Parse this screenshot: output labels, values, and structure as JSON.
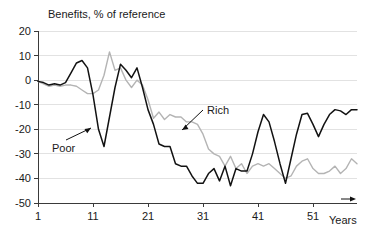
{
  "chart_data": {
    "type": "line",
    "title": "Benefits, % of reference",
    "xlabel": "Years",
    "ylabel": "",
    "xlim": [
      1,
      59
    ],
    "ylim": [
      -50,
      20
    ],
    "grid": true,
    "legend_position": "inline-annotations",
    "yticks": [
      20,
      10,
      0,
      -10,
      -20,
      -30,
      -40,
      -50
    ],
    "ytick_labels": [
      "20",
      "10",
      "0",
      "-10",
      "-20",
      "-30",
      "-40",
      "-50"
    ],
    "xticks": [
      1,
      11,
      21,
      31,
      41,
      51
    ],
    "xtick_labels": [
      "1",
      "11",
      "21",
      "31",
      "41",
      "51"
    ],
    "annotations": [
      {
        "label": "Poor",
        "series": "Poor",
        "text_x": 52,
        "text_y": 152,
        "tip_x": 91,
        "tip_y": 128
      },
      {
        "label": "Rich",
        "series": "Rich",
        "text_x": 207,
        "text_y": 114,
        "tip_x": 182,
        "tip_y": 130
      }
    ],
    "colors": {
      "poor": "#121212",
      "rich": "#b4b4b4",
      "axis": "#3a3a3a",
      "grid": "#e2e2e2"
    },
    "x": [
      1,
      2,
      3,
      4,
      5,
      6,
      7,
      8,
      9,
      10,
      11,
      12,
      13,
      14,
      15,
      16,
      17,
      18,
      19,
      20,
      21,
      22,
      23,
      24,
      25,
      26,
      27,
      28,
      29,
      30,
      31,
      32,
      33,
      34,
      35,
      36,
      37,
      38,
      39,
      40,
      41,
      42,
      43,
      44,
      45,
      46,
      47,
      48,
      49,
      50,
      51,
      52,
      53,
      54,
      55,
      56,
      57,
      58,
      59
    ],
    "series": [
      {
        "name": "Poor",
        "color": "#121212",
        "values": [
          -0.5,
          -1.0,
          -2.0,
          -1.5,
          -2.0,
          -1.0,
          3.0,
          7.0,
          8.0,
          5.0,
          -6.0,
          -20.0,
          -27.0,
          -15.0,
          -3.0,
          6.5,
          4.0,
          1.0,
          5.0,
          -3.0,
          -12.0,
          -18.0,
          -26.0,
          -27.0,
          -27.0,
          -34.0,
          -35.0,
          -35.0,
          -39.0,
          -42.0,
          -42.0,
          -38.0,
          -36.0,
          -41.0,
          -35.0,
          -43.0,
          -36.0,
          -37.0,
          -37.0,
          -30.0,
          -21.0,
          -14.0,
          -17.0,
          -25.0,
          -34.0,
          -42.0,
          -32.0,
          -22.0,
          -14.0,
          -13.5,
          -18.0,
          -23.0,
          -18.0,
          -14.0,
          -12.0,
          -12.5,
          -14.0,
          -12.0,
          -12.0
        ]
      },
      {
        "name": "Rich",
        "color": "#b4b4b4",
        "values": [
          -0.5,
          -1.5,
          -2.5,
          -2.0,
          -2.5,
          -2.0,
          -2.0,
          -2.5,
          -4.0,
          -5.5,
          -5.5,
          -4.0,
          2.0,
          11.5,
          4.0,
          5.0,
          0.0,
          -3.0,
          0.0,
          -2.0,
          -8.0,
          -15.5,
          -13.0,
          -16.0,
          -14.0,
          -15.0,
          -15.0,
          -17.0,
          -17.0,
          -18.0,
          -22.0,
          -28.0,
          -30.0,
          -31.0,
          -35.0,
          -31.0,
          -36.0,
          -34.0,
          -38.0,
          -35.0,
          -34.0,
          -35.0,
          -34.0,
          -36.0,
          -38.0,
          -40.0,
          -39.0,
          -35.0,
          -33.0,
          -32.0,
          -36.0,
          -38.0,
          -38.0,
          -37.0,
          -35.0,
          -38.0,
          -36.0,
          -32.0,
          -34.0
        ]
      }
    ]
  },
  "axis_titles": {
    "x_unit": "Years"
  }
}
